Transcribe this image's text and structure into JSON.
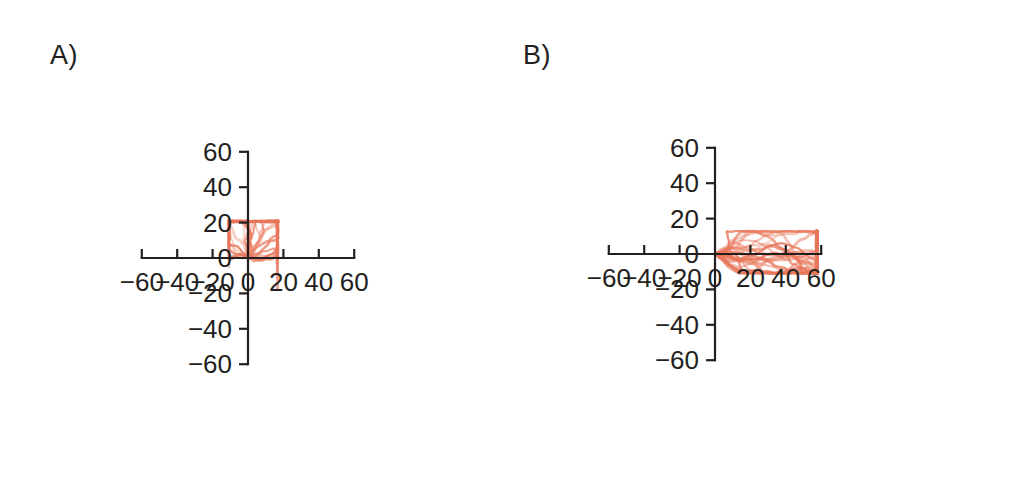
{
  "figure": {
    "background_color": "#ffffff",
    "axis_color": "#231f20",
    "trajectory_color": "#e8765a",
    "trajectory_color_light": "#f4a18c",
    "trajectory_color_dark": "#c0392b"
  },
  "panels": [
    {
      "id": "A",
      "label": "A)",
      "chart_data": {
        "type": "line",
        "title": "A)",
        "xlabel": "",
        "ylabel": "",
        "xlim": [
          -60,
          60
        ],
        "ylim": [
          -60,
          60
        ],
        "grid": false,
        "legend": "none",
        "xticks": [
          -60,
          -40,
          -20,
          0,
          20,
          40,
          60
        ],
        "xtick_labels": [
          "−60",
          "−40",
          "−20",
          "0",
          "20",
          "40",
          "60"
        ],
        "yticks": [
          -60,
          -40,
          -20,
          0,
          20,
          40,
          60
        ],
        "ytick_labels": [
          "−60",
          "−40",
          "−20",
          "0",
          "20",
          "40",
          "60"
        ],
        "description": "Overlaid random-walk cell migration tracks originating at the origin, compact and near-isotropic",
        "n_tracks": 26,
        "track_extent_x": [
          -11,
          17
        ],
        "track_extent_y": [
          -18,
          21
        ],
        "drift": [
          2.0,
          0.0
        ],
        "step_scale": 2.1,
        "angle_bias_deg": 90,
        "angle_spread_deg": 180,
        "seed": 1734
      }
    },
    {
      "id": "B",
      "label": "B)",
      "chart_data": {
        "type": "line",
        "title": "B)",
        "xlabel": "",
        "ylabel": "",
        "xlim": [
          -60,
          60
        ],
        "ylim": [
          -60,
          60
        ],
        "grid": false,
        "legend": "none",
        "xticks": [
          -60,
          -40,
          -20,
          0,
          20,
          40,
          60
        ],
        "xtick_labels": [
          "−60",
          "−40",
          "−20",
          "0",
          "20",
          "40",
          "60"
        ],
        "yticks": [
          -60,
          -40,
          -20,
          0,
          20,
          40,
          60
        ],
        "ytick_labels": [
          "−60",
          "−40",
          "−20",
          "0",
          "20",
          "40",
          "60"
        ],
        "description": "Overlaid directed cell migration tracks originating at the origin, strongly biased toward positive x",
        "n_tracks": 26,
        "track_extent_x": [
          0,
          58
        ],
        "track_extent_y": [
          -11,
          13
        ],
        "drift": [
          9.5,
          0.0
        ],
        "step_scale": 2.4,
        "angle_bias_deg": 0,
        "angle_spread_deg": 40,
        "seed": 9021
      }
    }
  ]
}
